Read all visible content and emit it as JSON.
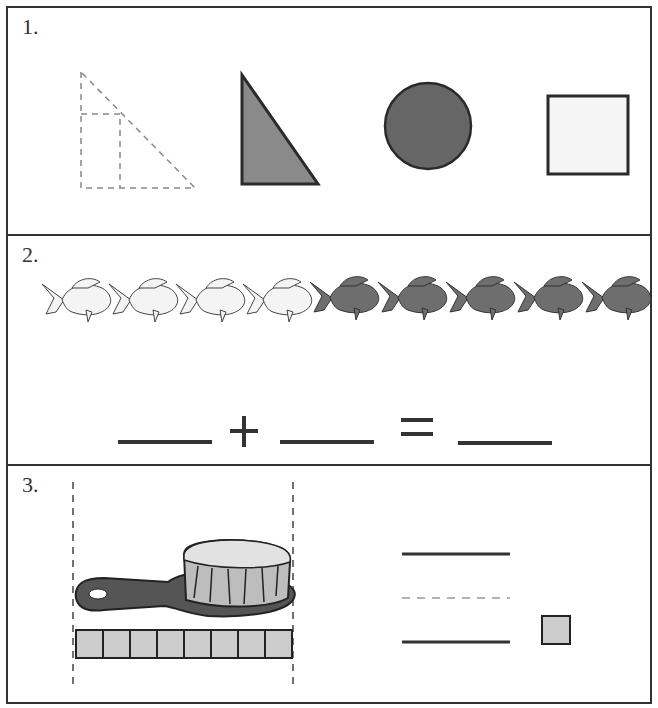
{
  "worksheet": {
    "problems": [
      {
        "number": "1.",
        "shapes": [
          "dashed-triangle-outline",
          "gray-right-triangle",
          "dark-gray-circle",
          "light-square"
        ]
      },
      {
        "number": "2.",
        "fish": {
          "white_count": 4,
          "gray_count": 5
        },
        "equation": {
          "plus": "+",
          "equals": "="
        }
      },
      {
        "number": "3.",
        "brush_units": 8,
        "unit_square": "gray-square"
      }
    ]
  },
  "colors": {
    "border": "#333333",
    "triangle_fill": "#8a8a8a",
    "circle_fill": "#666666",
    "square_fill": "#f5f5f5",
    "gray_fish": "#6e6e6e",
    "unit_fill": "#cccccc"
  }
}
